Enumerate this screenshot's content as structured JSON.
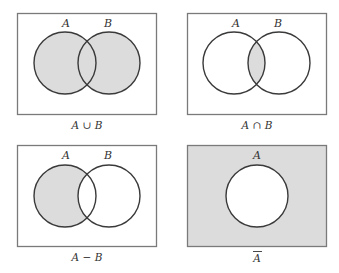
{
  "colors": {
    "fill": "#dcdcdc",
    "outline": "#3a3a3a",
    "box_border": "#7a7a7a",
    "background": "#ffffff"
  },
  "panels": [
    {
      "id": "union",
      "set_labels": [
        "A",
        "B"
      ],
      "caption": "A ∪ B",
      "shaded_region": "A union B"
    },
    {
      "id": "intersection",
      "set_labels": [
        "A",
        "B"
      ],
      "caption": "A ∩ B",
      "shaded_region": "A intersect B"
    },
    {
      "id": "difference",
      "set_labels": [
        "A",
        "B"
      ],
      "caption": "A − B",
      "shaded_region": "A minus B"
    },
    {
      "id": "complement",
      "set_labels": [
        "A"
      ],
      "caption": "A",
      "caption_overbar": true,
      "shaded_region": "complement of A"
    }
  ]
}
